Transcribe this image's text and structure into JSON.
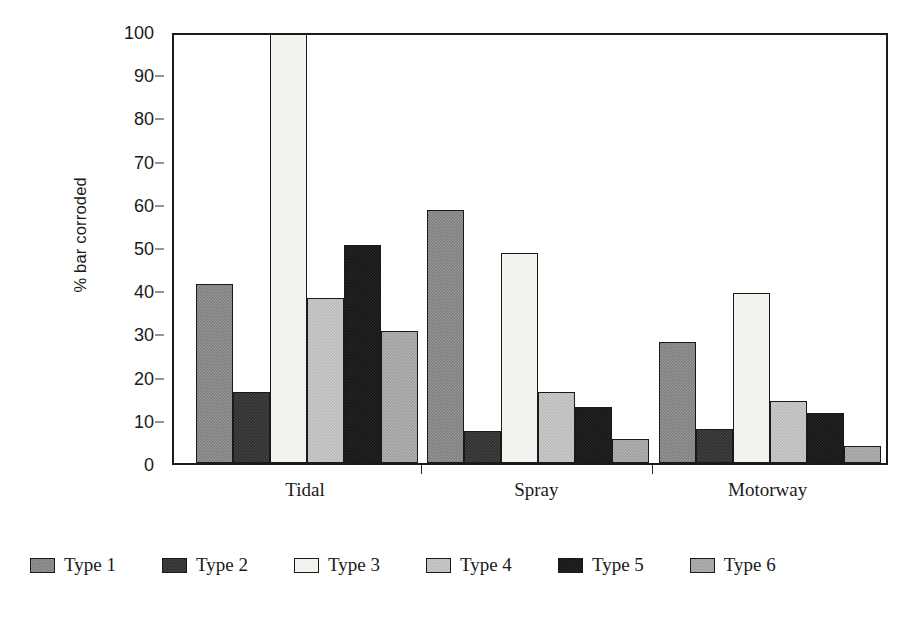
{
  "chart_data": {
    "type": "bar",
    "title": "",
    "subtitle": "",
    "xlabel": "",
    "ylabel": "% bar corroded",
    "ylim": [
      0,
      100
    ],
    "yticks": [
      0,
      10,
      20,
      30,
      40,
      50,
      60,
      70,
      80,
      90,
      100
    ],
    "ytick_labels": [
      "0",
      "10",
      "20",
      "30",
      "40",
      "50",
      "60",
      "70",
      "80",
      "90",
      "100"
    ],
    "grid": false,
    "legend_position": "bottom",
    "categories": [
      "Tidal",
      "Spray",
      "Motorway"
    ],
    "series": [
      {
        "name": "Type 1",
        "color": "#7d7d7d",
        "values": [
          41.5,
          58.5,
          28.0
        ]
      },
      {
        "name": "Type 2",
        "color": "#2f2f2f",
        "values": [
          16.5,
          7.5,
          7.8
        ]
      },
      {
        "name": "Type 3",
        "color": "#f2f2ee",
        "values": [
          100.0,
          48.5,
          39.3
        ]
      },
      {
        "name": "Type 4",
        "color": "#b9b9b9",
        "values": [
          38.2,
          16.5,
          14.3
        ]
      },
      {
        "name": "Type 5",
        "color": "#161616",
        "values": [
          50.5,
          13.0,
          11.5
        ]
      },
      {
        "name": "Type 6",
        "color": "#9d9d9d",
        "values": [
          30.5,
          5.5,
          4.0
        ]
      }
    ]
  },
  "axis": {
    "y_title": "% bar corroded"
  },
  "legend": {
    "items": [
      {
        "label": "Type 1"
      },
      {
        "label": "Type 2"
      },
      {
        "label": "Type 3"
      },
      {
        "label": "Type 4"
      },
      {
        "label": "Type 5"
      },
      {
        "label": "Type 6"
      }
    ]
  }
}
